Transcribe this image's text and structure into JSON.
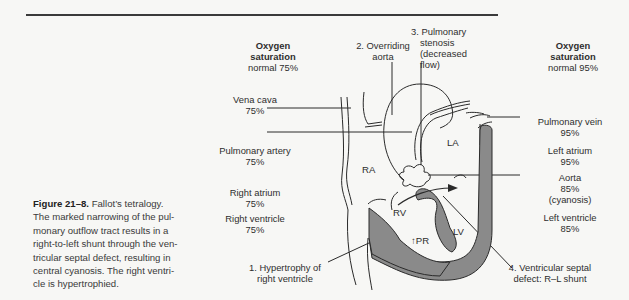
{
  "figure": {
    "number": "Figure 21–8.",
    "caption": "Fallot’s tetralogy. The marked narrowing of the pulmonary outflow tract results in a right-to-left shunt through the ventricular septal defect, resulting in central cyanosis. The right ventricle is hypertrophied.",
    "caption_lines": [
      "The marked narrowing of the pul-",
      "monary outflow tract results in a",
      "right-to-left shunt through the ven-",
      "tricular septal defect, resulting in",
      "central cyanosis. The right ventri-",
      "cle is hypertrophied."
    ],
    "caption_first": "Fallot’s tetralogy."
  },
  "left_column": {
    "header_line1": "Oxygen",
    "header_line2": "saturation",
    "header_line3": "normal 75%",
    "items": [
      {
        "name": "Vena cava",
        "value": "75%"
      },
      {
        "name": "Pulmonary artery",
        "value": "75%"
      },
      {
        "name": "Right atrium",
        "value": "75%"
      },
      {
        "name": "Right ventricle",
        "value": "75%"
      }
    ]
  },
  "right_column": {
    "header_line1": "Oxygen",
    "header_line2": "saturation",
    "header_line3": "normal 95%",
    "items": [
      {
        "name": "Pulmonary vein",
        "value": "95%"
      },
      {
        "name": "Left atrium",
        "value": "95%"
      },
      {
        "name": "Aorta",
        "value": "85%",
        "note": "(cyanosis)"
      },
      {
        "name": "Left ventricle",
        "value": "85%"
      }
    ]
  },
  "defects": [
    {
      "line1": "1. Hypertrophy of",
      "line2": "right ventricle"
    },
    {
      "line1": "2. Overriding",
      "line2": "aorta"
    },
    {
      "line1": "3. Pulmonary",
      "line2": "stenosis",
      "line3": "(decreased",
      "line4": "flow)"
    },
    {
      "line1": "4. Ventricular septal",
      "line2": "defect: R–L shunt"
    }
  ],
  "chambers": {
    "ra": "RA",
    "la": "LA",
    "rv": "RV",
    "lv": "LV",
    "pr": "↑PR"
  },
  "colors": {
    "background": "#f7f7f5",
    "line": "#2a2a2a",
    "muscle_fill": "#8a8a8a"
  }
}
